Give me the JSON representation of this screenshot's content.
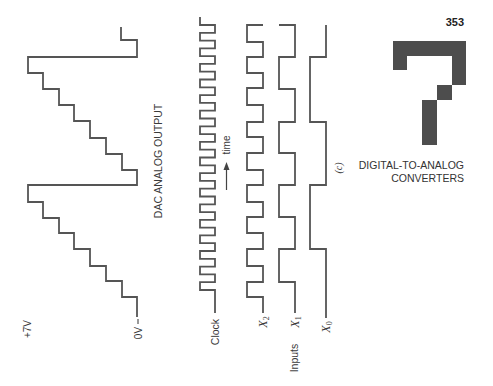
{
  "page": {
    "number": "353",
    "running_head": {
      "line1": "DIGITAL-TO-ANALOG",
      "line2": "CONVERTERS"
    },
    "chapter_glyph": {
      "number": "7",
      "color": "#4d4d4d",
      "path": "M393,41 H466 V85 H452 V56 H407 V70 H393 Z M437,85 H452 V100 H437 Z M422,100 H437 V145 H422 Z"
    }
  },
  "figure": {
    "part_label": "(c)",
    "stroke_color": "#555555",
    "dac_output": {
      "label": "DAC ANALOG OUTPUT",
      "top_voltage": "+7V",
      "bottom_voltage": "0V",
      "steps_per_cycle": 8,
      "levels": [
        0,
        1,
        2,
        3,
        4,
        5,
        6,
        7,
        0,
        1,
        2,
        3,
        4,
        5,
        6,
        7,
        0,
        1
      ],
      "path": "M137,317 V297 H122 V281 H106 V266 H90 V249 H74 V233 H59 V218 H43 V202 H28 V185 H137 V170 H122 V154 H106 V138 H90 V121 H74 V105 H59 V89 H43 V73 H28 V57 H137 V40 H121 V27"
    },
    "clock": {
      "label": "Clock",
      "pulses": 18,
      "path": "M215,313 V290 H200 V282.2 H215 V274.4 H200 V266.6 H215 V258.8 H200 V251 H215 V243.2 H200 V235.4 H215 V227.6 H200 V219.8 H215 V212.1 H200 V204.3 H215 V196.5 H200 V188.7 H215 V180.9 H200 V173.1 H215 V165.3 H200 V157.5 H215 V149.7 H200 V141.9 H215 V134.1 H200 V126.3 H215 V118.5 H200 V110.7 H215 V102.9 H200 V95.1 H215 V87.3 H200 V79.5 H215 V71.7 H200 V63.9 H215 V56.2 H200 V48.4 H215 V40.6 H200 V32.8 H215 V25 H200 V17"
    },
    "time_axis": {
      "label": "time",
      "direction": "up"
    },
    "inputs": {
      "group_label": "Inputs",
      "x2": {
        "symbol": "X",
        "subscript": "2",
        "bits": [
          0,
          1,
          0,
          1,
          0,
          1,
          0,
          1,
          0,
          1,
          0,
          1,
          0,
          1,
          0,
          1,
          0,
          1
        ],
        "path": "M263,313 V297 H247 V282 H263 V266 H247 V249 H263 V233 H247 V217 H263 V202 H247 V185 H263 V170 H247 V153 H263 V137 H247 V122 H263 V105 H247 V88 H263 V73 H247 V57 H263 V42 H247 V25 H263"
      },
      "x1": {
        "symbol": "X",
        "subscript": "1",
        "bits": [
          0,
          0,
          1,
          1,
          0,
          0,
          1,
          1,
          0,
          0,
          1,
          1,
          0,
          0,
          1,
          1,
          0,
          0
        ],
        "path": "M295,313 V282 H279 V249 H295 V217 H279 V185 H295 V153 H279 V122 H295 V89 H279 V57 H295 V25 H279"
      },
      "x0": {
        "symbol": "X",
        "subscript": "0",
        "bits": [
          0,
          0,
          0,
          0,
          1,
          1,
          1,
          1,
          0,
          0,
          0,
          0,
          1,
          1,
          1,
          1,
          0,
          0
        ],
        "path": "M326,318 V249 H310 V185 H326 V122 H310 V57 H326 V25"
      }
    }
  }
}
